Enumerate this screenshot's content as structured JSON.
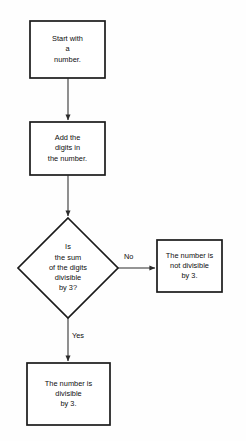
{
  "diagram": {
    "colors": {
      "stroke": "#1a1a1a",
      "fill": "#ffffff",
      "connector": "#2b2b2b",
      "text": "#0d0d0d",
      "background": "#fefefe"
    },
    "nodes": [
      {
        "id": "start",
        "shape": "rectangle",
        "lines": [
          "Start with",
          "a",
          "number."
        ]
      },
      {
        "id": "add-digits",
        "shape": "rectangle",
        "lines": [
          "Add the",
          "digits in",
          "the number."
        ]
      },
      {
        "id": "decision",
        "shape": "diamond",
        "lines": [
          "Is",
          "the sum",
          "of the digits",
          "divisible",
          "by 3?"
        ]
      },
      {
        "id": "not-divisible",
        "shape": "rectangle",
        "lines": [
          "The number is",
          "not divisible",
          "by 3."
        ]
      },
      {
        "id": "divisible",
        "shape": "rectangle",
        "lines": [
          "The number is",
          "divisible",
          "by 3."
        ]
      }
    ],
    "edges": [
      {
        "id": "start-to-add",
        "from": "start",
        "to": "add-digits",
        "label": ""
      },
      {
        "id": "add-to-decision",
        "from": "add-digits",
        "to": "decision",
        "label": ""
      },
      {
        "id": "decision-to-not-divisible",
        "from": "decision",
        "to": "not-divisible",
        "label": "No"
      },
      {
        "id": "decision-to-divisible",
        "from": "decision",
        "to": "divisible",
        "label": "Yes"
      }
    ]
  }
}
